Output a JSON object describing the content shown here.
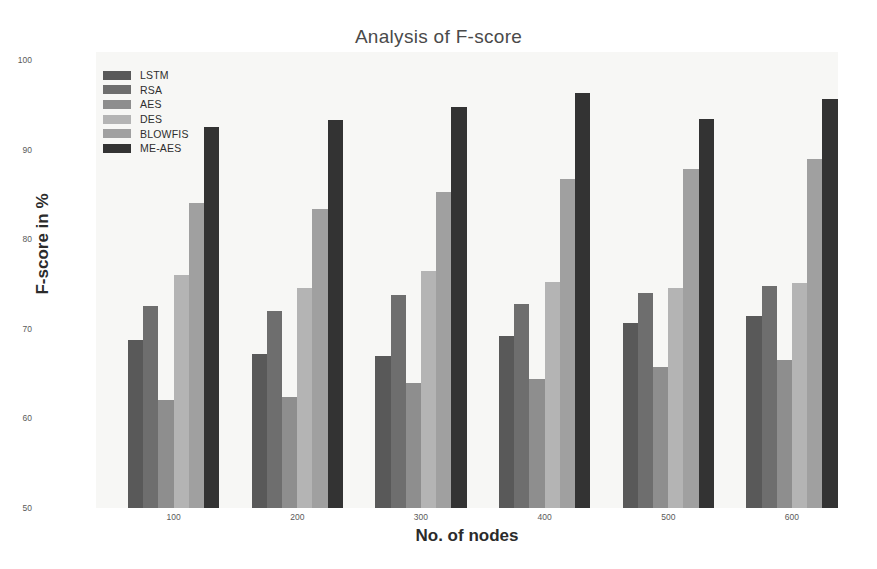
{
  "chart_data": {
    "type": "bar",
    "title": "Analysis of F-score",
    "xlabel": "No. of nodes",
    "ylabel": "F-score in %",
    "categories": [
      "100",
      "200",
      "300",
      "400",
      "500",
      "600"
    ],
    "ylim": [
      50,
      100
    ],
    "yticks": [
      "50",
      "60",
      "70",
      "80",
      "90",
      "100"
    ],
    "grid": false,
    "legend_position": "upper-left-inside",
    "series": [
      {
        "name": "LSTM",
        "color": "#595959",
        "values": [
          68.8,
          67.2,
          67.0,
          69.2,
          70.7,
          71.4
        ]
      },
      {
        "name": "RSA",
        "color": "#6e6e6e",
        "values": [
          72.5,
          72.0,
          73.8,
          72.8,
          74.0,
          74.8
        ]
      },
      {
        "name": "AES",
        "color": "#8e8e8e",
        "values": [
          62.0,
          62.4,
          64.0,
          64.4,
          65.7,
          66.5
        ]
      },
      {
        "name": "DES",
        "color": "#b4b4b4",
        "values": [
          76.0,
          74.5,
          76.4,
          75.2,
          74.5,
          75.1
        ]
      },
      {
        "name": "BLOWFIS",
        "color": "#a0a0a0",
        "values": [
          84.0,
          83.4,
          85.3,
          86.7,
          87.8,
          88.9
        ]
      },
      {
        "name": "ME-AES",
        "color": "#333333",
        "values": [
          92.5,
          93.3,
          94.8,
          96.3,
          93.4,
          95.6
        ]
      }
    ]
  },
  "figure": {
    "background": "#ffffff",
    "plot_background": "#f7f7f5",
    "title_color": "#4a4a4a",
    "tick_color": "#5a5a5a",
    "axis_label_color": "#2b2b2b"
  }
}
